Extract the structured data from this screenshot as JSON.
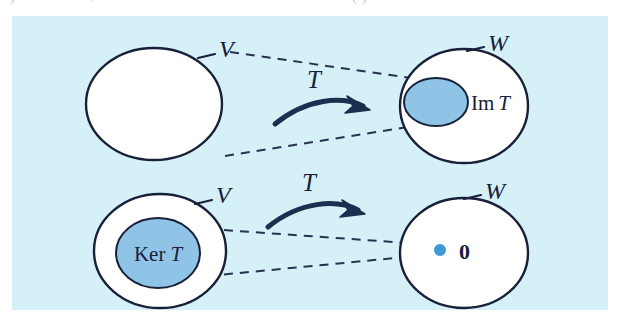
{
  "figure": {
    "kind": "math-diagram",
    "background_color": "#d6f0f7",
    "page_color": "#ffffff",
    "outline_color": "#18203a",
    "set_fill_color": "#ffffff",
    "highlight_fill_color": "#8fc4e6",
    "arrow_color": "#1b3050",
    "dot_color": "#3d9ad8",
    "rows": [
      {
        "id": "image-row",
        "source": {
          "id": "top-domain",
          "label": "V",
          "label_style": "italic",
          "fill": "#ffffff"
        },
        "map": {
          "id": "top-map-arrow",
          "label": "T",
          "label_style": "italic",
          "direction": "left-to-right"
        },
        "target": {
          "id": "top-codomain",
          "label": "W",
          "label_style": "italic",
          "fill": "#ffffff",
          "subset": {
            "id": "image-set",
            "label": "Im T",
            "label_upright": "Im",
            "label_italic": "T",
            "label_position": "outside-right",
            "fill": "#8fc4e6"
          }
        },
        "connectors": [
          "upper-dashed-guide",
          "lower-dashed-guide"
        ]
      },
      {
        "id": "kernel-row",
        "source": {
          "id": "bottom-domain",
          "label": "V",
          "label_style": "italic",
          "fill": "#ffffff",
          "subset": {
            "id": "kernel-set",
            "label": "Ker T",
            "label_upright": "Ker",
            "label_italic": "T",
            "label_position": "inside",
            "fill": "#8fc4e6"
          }
        },
        "map": {
          "id": "bottom-map-arrow",
          "label": "T",
          "label_style": "italic",
          "direction": "left-to-right"
        },
        "target": {
          "id": "bottom-codomain",
          "label": "W",
          "label_style": "italic",
          "fill": "#ffffff",
          "point": {
            "id": "zero-vector",
            "label": "0",
            "label_style": "bold",
            "dot_color": "#3d9ad8"
          }
        },
        "connectors": [
          "upper-dashed-guide",
          "lower-dashed-guide"
        ]
      }
    ],
    "bleed_text": {
      "left_fragment": ")",
      "mid_fragment": "/",
      "right_fragment": "(-)"
    }
  }
}
